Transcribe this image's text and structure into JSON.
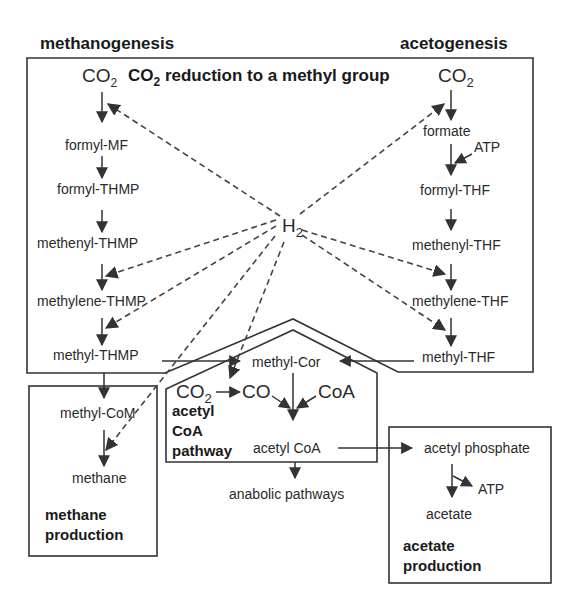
{
  "title": "CO2 reduction to a methyl group",
  "sections": {
    "methanogenesis": "methanogenesis",
    "acetogenesis": "acetogenesis"
  },
  "methanogenesis_path": {
    "start": "CO",
    "start_sub": "2",
    "steps": [
      "formyl-MF",
      "formyl-THMP",
      "methenyl-THMP",
      "methylene-THMP",
      "methyl-THMP",
      "methyl-CoM",
      "methane"
    ]
  },
  "acetogenesis_path": {
    "start": "CO",
    "start_sub": "2",
    "steps": [
      "formate",
      "formyl-THF",
      "methenyl-THF",
      "methylene-THF",
      "methyl-THF"
    ],
    "atp": "ATP"
  },
  "reductant": {
    "label": "H",
    "sub": "2"
  },
  "acetyl_coa_pathway": {
    "methyl_cor": "methyl-Cor",
    "co2": "CO",
    "co2_sub": "2",
    "co": "CO",
    "coa": "CoA",
    "acetyl_coa": "acetyl CoA",
    "label_lines": [
      "acetyl",
      "CoA",
      "pathway"
    ],
    "anabolic": "anabolic pathways"
  },
  "methane_production": {
    "label_lines": [
      "methane",
      "production"
    ]
  },
  "acetate_production": {
    "acetyl_phosphate": "acetyl phosphate",
    "atp": "ATP",
    "acetate": "acetate",
    "label_lines": [
      "acetate",
      "production"
    ]
  },
  "header": {
    "co2_prefix": "CO",
    "co2_sub": "2",
    "rest": " reduction to a methyl group"
  }
}
